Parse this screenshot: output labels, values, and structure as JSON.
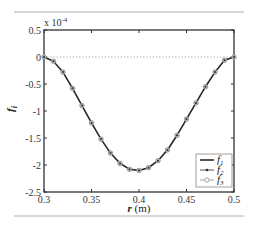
{
  "chart_data": {
    "type": "line",
    "title": "",
    "xlabel": "r (m)",
    "ylabel": "f_i",
    "y_multiplier": "x 10^-4",
    "xlim": [
      0.3,
      0.5
    ],
    "ylim": [
      -2.5,
      0.5
    ],
    "x_ticks": [
      0.3,
      0.35,
      0.4,
      0.45,
      0.5
    ],
    "x_tick_labels": [
      "0.3",
      "0.35",
      "0.4",
      "0.45",
      "0.5"
    ],
    "y_ticks": [
      0.5,
      0,
      -0.5,
      -1,
      -1.5,
      -2,
      -2.5
    ],
    "y_tick_labels": [
      "0.5",
      "0",
      "-0.5",
      "-1",
      "-1.5",
      "-2",
      "-2.5"
    ],
    "grid": false,
    "reference_line": {
      "y": 0,
      "style": "dotted"
    },
    "legend_position": "lower right",
    "x": [
      0.3,
      0.31,
      0.32,
      0.33,
      0.34,
      0.35,
      0.36,
      0.37,
      0.38,
      0.39,
      0.4,
      0.41,
      0.42,
      0.43,
      0.44,
      0.45,
      0.46,
      0.47,
      0.48,
      0.49,
      0.5
    ],
    "series": [
      {
        "name": "f1",
        "label_main": "f",
        "label_sub": "1",
        "style": "solid line",
        "values": [
          0,
          -0.08,
          -0.28,
          -0.58,
          -0.9,
          -1.22,
          -1.52,
          -1.78,
          -1.97,
          -2.08,
          -2.1,
          -2.05,
          -1.92,
          -1.72,
          -1.45,
          -1.15,
          -0.85,
          -0.55,
          -0.28,
          -0.06,
          0
        ]
      },
      {
        "name": "f2",
        "label_main": "f",
        "label_sub": "2",
        "style": "line with dot markers",
        "values": [
          0,
          -0.08,
          -0.28,
          -0.58,
          -0.9,
          -1.22,
          -1.52,
          -1.78,
          -1.97,
          -2.08,
          -2.1,
          -2.05,
          -1.92,
          -1.72,
          -1.45,
          -1.15,
          -0.85,
          -0.55,
          -0.28,
          -0.06,
          0
        ]
      },
      {
        "name": "f3",
        "label_main": "f",
        "label_sub": "3",
        "style": "line with circle markers",
        "values": [
          0,
          -0.08,
          -0.28,
          -0.58,
          -0.9,
          -1.22,
          -1.52,
          -1.78,
          -1.97,
          -2.08,
          -2.1,
          -2.05,
          -1.92,
          -1.72,
          -1.45,
          -1.15,
          -0.85,
          -0.55,
          -0.28,
          -0.06,
          0
        ]
      }
    ]
  },
  "labels": {
    "multiplier_base": "x 10",
    "multiplier_exp": "-4",
    "ylabel_main": "f",
    "ylabel_sub": "i",
    "xlabel_var": "r",
    "xlabel_unit": " (m)"
  },
  "colors": {
    "axis": "#333333",
    "line": "#2a2a2a",
    "marker": "#8a8a8a",
    "reference": "#9a9a9a",
    "frame_rule": "#b0b0b0"
  }
}
